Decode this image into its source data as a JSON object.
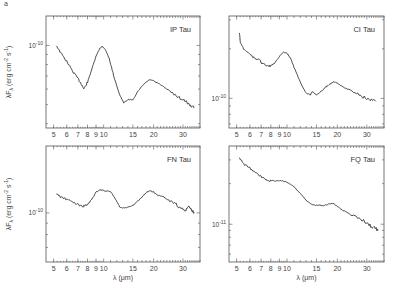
{
  "figure": {
    "x_axis_label": "λ (μm)",
    "y_axis_label": "λF",
    "y_axis_label_sub": "λ",
    "y_axis_label_units": "(erg cm",
    "y_axis_label_units_exp": "-2",
    "y_axis_label_units2": " s",
    "y_axis_label_units_exp2": "-1",
    "y_axis_label_close": ")"
  },
  "chart_data": [
    {
      "type": "line",
      "title": "IP Tau",
      "xlabel": "λ (μm)",
      "ylabel": "λF_λ (erg cm^-2 s^-1)",
      "xscale": "log",
      "yscale": "log",
      "xlim": [
        4.5,
        38
      ],
      "xticks": [
        5,
        6,
        7,
        8,
        9,
        10,
        15,
        20,
        30
      ],
      "yticks": [
        {
          "value": 1e-10,
          "label": "10^-10"
        }
      ],
      "x": [
        5.2,
        5.5,
        6.0,
        6.5,
        7.0,
        7.4,
        7.6,
        8.0,
        8.5,
        9.0,
        9.5,
        9.8,
        10.2,
        10.8,
        11.5,
        12.5,
        13.2,
        14.0,
        15.0,
        16.0,
        17.0,
        18.0,
        19.0,
        20.0,
        22.0,
        24.0,
        27.0,
        30.0,
        33.0,
        35.0
      ],
      "values": [
        1e-10,
        9.2e-11,
        8.3e-11,
        7.4e-11,
        6.8e-11,
        6.3e-11,
        6e-11,
        6.5e-11,
        7.6e-11,
        8.8e-11,
        9.7e-11,
        9.9e-11,
        9.6e-11,
        8.6e-11,
        7e-11,
        5.6e-11,
        5.1e-11,
        5.3e-11,
        5.3e-11,
        5.8e-11,
        6.2e-11,
        6.5e-11,
        6.7e-11,
        6.6e-11,
        6.3e-11,
        6e-11,
        5.6e-11,
        5.3e-11,
        5e-11,
        4.8e-11
      ]
    },
    {
      "type": "line",
      "title": "CI Tau",
      "xlabel": "λ (μm)",
      "ylabel": "",
      "xscale": "log",
      "yscale": "log",
      "xlim": [
        4.5,
        38
      ],
      "xticks": [
        5,
        6,
        7,
        8,
        9,
        10,
        15,
        20,
        30
      ],
      "yticks": [
        {
          "value": 1e-10,
          "label": "10^-10"
        }
      ],
      "x": [
        5.2,
        5.25,
        5.5,
        6.0,
        6.5,
        6.8,
        7.0,
        7.5,
        8.0,
        8.5,
        9.0,
        9.5,
        10.0,
        10.5,
        11.0,
        12.0,
        13.0,
        13.8,
        14.2,
        15.0,
        16.0,
        17.0,
        18.0,
        19.0,
        20.0,
        22.0,
        25.0,
        28.0,
        31.0,
        34.0
      ],
      "values": [
        2.5e-10,
        2.2e-10,
        2e-10,
        1.85e-10,
        1.72e-10,
        1.75e-10,
        1.65e-10,
        1.58e-10,
        1.57e-10,
        1.65e-10,
        1.8e-10,
        1.9e-10,
        1.88e-10,
        1.75e-10,
        1.55e-10,
        1.25e-10,
        1.08e-10,
        1.05e-10,
        1.1e-10,
        1.05e-10,
        1.1e-10,
        1.17e-10,
        1.22e-10,
        1.26e-10,
        1.24e-10,
        1.16e-10,
        1.1e-10,
        1.03e-10,
        9.8e-11,
        9.6e-11
      ]
    },
    {
      "type": "line",
      "title": "FN Tau",
      "xlabel": "λ (μm)",
      "ylabel": "λF_λ (erg cm^-2 s^-1)",
      "xscale": "log",
      "yscale": "log",
      "xlim": [
        4.5,
        38
      ],
      "xticks": [
        5,
        6,
        7,
        8,
        9,
        10,
        15,
        20,
        30
      ],
      "yticks": [
        {
          "value": 1e-10,
          "label": "10^-10"
        }
      ],
      "x": [
        5.2,
        5.5,
        6.0,
        6.5,
        7.0,
        7.5,
        8.0,
        8.5,
        9.0,
        9.5,
        10.0,
        11.0,
        11.8,
        12.5,
        13.5,
        15.0,
        16.5,
        18.0,
        19.0,
        20.0,
        21.0,
        23.0,
        25.0,
        27.0,
        29.0,
        31.0,
        32.5,
        34.0,
        35.0
      ],
      "values": [
        1.22e-10,
        1.18e-10,
        1.15e-10,
        1.12e-10,
        1.09e-10,
        1.07e-10,
        1.09e-10,
        1.15e-10,
        1.24e-10,
        1.27e-10,
        1.26e-10,
        1.25e-10,
        1.15e-10,
        1.06e-10,
        1.05e-10,
        1.08e-10,
        1.15e-10,
        1.23e-10,
        1.26e-10,
        1.24e-10,
        1.2e-10,
        1.18e-10,
        1.13e-10,
        1.1e-10,
        1.05e-10,
        1.02e-10,
        1.07e-10,
        1.02e-10,
        1.01e-10
      ]
    },
    {
      "type": "line",
      "title": "FQ Tau",
      "xlabel": "λ (μm)",
      "ylabel": "",
      "xscale": "log",
      "yscale": "log",
      "xlim": [
        4.5,
        38
      ],
      "xticks": [
        5,
        6,
        7,
        8,
        9,
        10,
        15,
        20,
        30
      ],
      "yticks": [
        {
          "value": 1e-11,
          "label": "10^-11"
        }
      ],
      "x": [
        5.2,
        5.5,
        6.0,
        6.5,
        7.0,
        7.5,
        8.0,
        8.5,
        9.0,
        9.5,
        10.0,
        11.0,
        12.0,
        13.0,
        14.0,
        15.0,
        16.5,
        18.0,
        19.0,
        20.0,
        22.0,
        25.0,
        28.0,
        30.0,
        32.0,
        34.0,
        35.0
      ],
      "values": [
        3.1e-11,
        2.8e-11,
        2.6e-11,
        2.4e-11,
        2.25e-11,
        2.15e-11,
        2.1e-11,
        2.1e-11,
        2.1e-11,
        2.1e-11,
        2.05e-11,
        1.9e-11,
        1.7e-11,
        1.5e-11,
        1.4e-11,
        1.38e-11,
        1.38e-11,
        1.42e-11,
        1.43e-11,
        1.35e-11,
        1.25e-11,
        1.15e-11,
        1.08e-11,
        1.02e-11,
        9.6e-12,
        9.3e-12,
        9e-12
      ]
    }
  ],
  "top_corner_mark": "a"
}
